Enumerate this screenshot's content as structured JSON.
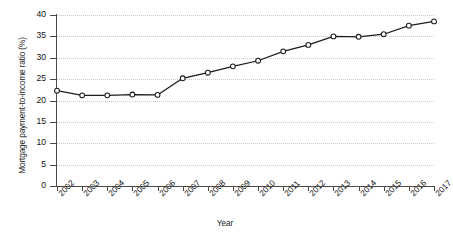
{
  "chart_data": {
    "type": "line",
    "title": "",
    "xlabel": "Year",
    "ylabel": "Mortgage payment-to-income ratio (%)",
    "categories": [
      "2002",
      "2003",
      "2004",
      "2005",
      "2006",
      "2007",
      "2008",
      "2009",
      "2010",
      "2011",
      "2012",
      "2013",
      "2014",
      "2015",
      "2016",
      "2017"
    ],
    "values": [
      22.3,
      21.2,
      21.2,
      21.4,
      21.3,
      25.2,
      26.5,
      28.0,
      29.3,
      31.5,
      33.0,
      35.0,
      34.9,
      35.5,
      37.5,
      38.5
    ],
    "series": [
      {
        "name": "Mortgage payment-to-income ratio",
        "values": [
          22.3,
          21.2,
          21.2,
          21.4,
          21.3,
          25.2,
          26.5,
          28.0,
          29.3,
          31.5,
          33.0,
          35.0,
          34.9,
          35.5,
          37.5,
          38.5
        ]
      }
    ],
    "ylim": [
      0,
      40
    ],
    "yticks": [
      0,
      5,
      10,
      15,
      20,
      25,
      30,
      35,
      40
    ],
    "ytick_labels": [
      "0",
      "5",
      "10",
      "15",
      "20",
      "25",
      "30",
      "35",
      "40"
    ],
    "grid": "horizontal-dotted",
    "legend": "none",
    "marker": "open-circle",
    "line_color": "#1c1c1c",
    "marker_fill": "#ffffff",
    "grid_color": "#c9c9c9",
    "axis_color": "#4a4a4a",
    "background": "#ffffff"
  }
}
